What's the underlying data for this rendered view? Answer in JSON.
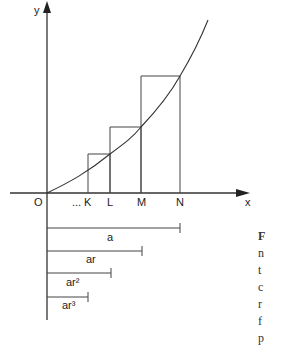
{
  "diagram": {
    "axis_labels": {
      "y": "y",
      "x": "x",
      "origin": "O"
    },
    "x_points": [
      {
        "label": "...",
        "x": 75
      },
      {
        "label": "K",
        "x": 88
      },
      {
        "label": "L",
        "x": 110
      },
      {
        "label": "M",
        "x": 141
      },
      {
        "label": "N",
        "x": 180
      }
    ],
    "segments": [
      {
        "label": "a",
        "length_to_x": 180
      },
      {
        "label": "ar",
        "length_to_x": 142
      },
      {
        "label": "ar²",
        "length_to_x": 111
      },
      {
        "label": "ar³",
        "length_to_x": 88
      }
    ]
  },
  "caption_fragment": [
    "F",
    "n",
    "t",
    "c",
    "r",
    "f",
    "p"
  ]
}
